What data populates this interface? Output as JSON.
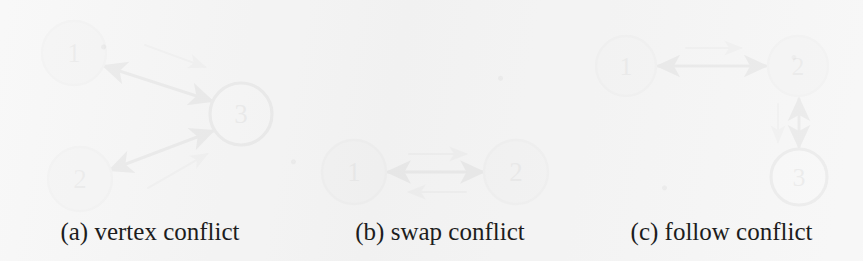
{
  "figure": {
    "width": 863,
    "height": 261,
    "background_color": "#f2f2f2"
  },
  "style": {
    "node_fill_gray": "#cfcfcf",
    "node_stroke_gray": "#9a9a9a",
    "node_fill_white": "#fafafa",
    "node_stroke_dark": "#222222",
    "edge_color": "#1a1a1a",
    "move_arrow_color": "#8c8c8c",
    "label_color": "#1d1d1d"
  },
  "panels": [
    {
      "id": "a",
      "caption": "(a) vertex conflict",
      "nodes": [
        {
          "label": "1",
          "cx": 74,
          "cy": 53,
          "r": 32,
          "fill": "gray"
        },
        {
          "label": "2",
          "cx": 80,
          "cy": 179,
          "r": 32,
          "fill": "gray"
        },
        {
          "label": "3",
          "cx": 241,
          "cy": 114,
          "r": 31,
          "fill": "white"
        }
      ],
      "edges": [
        {
          "from": "1",
          "to": "3",
          "kind": "double-headed"
        },
        {
          "from": "2",
          "to": "3",
          "kind": "double-headed"
        }
      ],
      "move_arrows": [
        {
          "from": "1",
          "to": "3",
          "direction": "down-right"
        },
        {
          "from": "2",
          "to": "3",
          "direction": "up-right"
        }
      ]
    },
    {
      "id": "b",
      "caption": "(b) swap conflict",
      "nodes": [
        {
          "label": "1",
          "cx": 354,
          "cy": 172,
          "r": 32,
          "fill": "gray"
        },
        {
          "label": "2",
          "cx": 516,
          "cy": 172,
          "r": 32,
          "fill": "gray"
        }
      ],
      "edges": [
        {
          "from": "1",
          "to": "2",
          "kind": "double-headed"
        }
      ],
      "move_arrows": [
        {
          "from": "1",
          "to": "2",
          "direction": "right"
        },
        {
          "from": "2",
          "to": "1",
          "direction": "left"
        }
      ]
    },
    {
      "id": "c",
      "caption": "(c) follow conflict",
      "nodes": [
        {
          "label": "1",
          "cx": 626,
          "cy": 66,
          "r": 30,
          "fill": "gray"
        },
        {
          "label": "2",
          "cx": 798,
          "cy": 66,
          "r": 30,
          "fill": "gray"
        },
        {
          "label": "3",
          "cx": 799,
          "cy": 177,
          "r": 28,
          "fill": "white"
        }
      ],
      "edges": [
        {
          "from": "1",
          "to": "2",
          "kind": "double-headed"
        },
        {
          "from": "2",
          "to": "3",
          "kind": "double-headed"
        }
      ],
      "move_arrows": [
        {
          "from": "1",
          "to": "2",
          "direction": "right"
        },
        {
          "from": "2",
          "to": "3",
          "direction": "down"
        }
      ]
    }
  ]
}
